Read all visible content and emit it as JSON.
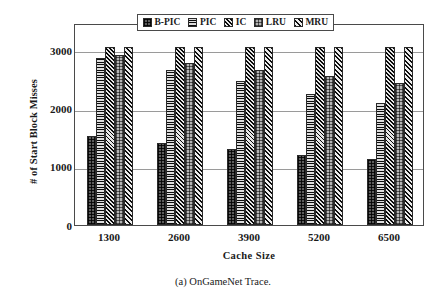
{
  "chart_data": {
    "type": "bar",
    "title": "",
    "xlabel": "Cache Size",
    "ylabel": "# of Start Block Misses",
    "categories": [
      "1300",
      "2600",
      "3900",
      "5200",
      "6500"
    ],
    "series": [
      {
        "name": "B-PIC",
        "pattern": "dotted-dark",
        "values": [
          1530,
          1410,
          1310,
          1200,
          1140
        ]
      },
      {
        "name": "PIC",
        "pattern": "horizontal",
        "values": [
          2870,
          2670,
          2470,
          2250,
          2100
        ]
      },
      {
        "name": "IC",
        "pattern": "cross-hatch",
        "values": [
          3060,
          3060,
          3060,
          3060,
          3060
        ]
      },
      {
        "name": "LRU",
        "pattern": "light-checker",
        "values": [
          2920,
          2790,
          2670,
          2560,
          2440
        ]
      },
      {
        "name": "MRU",
        "pattern": "diagonal",
        "values": [
          3060,
          3060,
          3060,
          3060,
          3060
        ]
      }
    ],
    "yticks": [
      0,
      1000,
      2000,
      3000
    ],
    "ylim": [
      0,
      3470
    ],
    "grid": true,
    "legend_position": "top-center"
  },
  "caption": "(a) OnGameNet Trace."
}
